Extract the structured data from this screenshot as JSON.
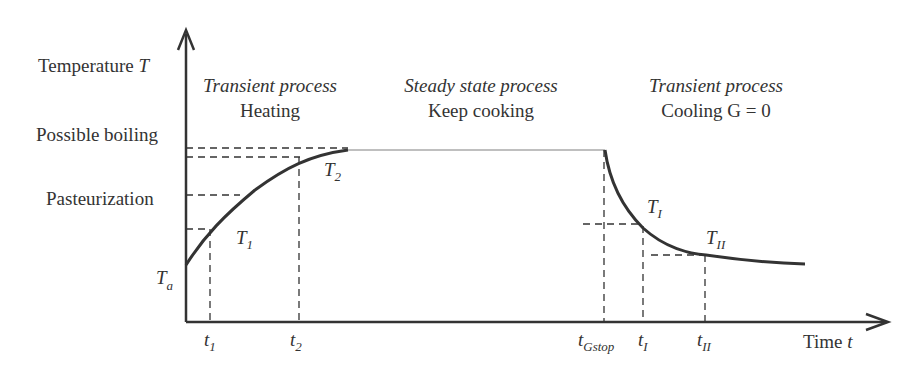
{
  "diagram": {
    "y_axis_label": "Temperature",
    "y_axis_symbol": "T",
    "x_axis_label": "Time",
    "x_axis_symbol": "t",
    "y_levels": {
      "possible_boiling": "Possible boiling",
      "pasteurization": "Pasteurization",
      "ambient": "T",
      "ambient_sub": "a"
    },
    "phases": [
      {
        "title": "Transient process",
        "subtitle": "Heating"
      },
      {
        "title": "Steady state process",
        "subtitle": "Keep cooking"
      },
      {
        "title": "Transient process",
        "subtitle": "Cooling G = 0"
      }
    ],
    "points": [
      {
        "label": "T",
        "sub": "1"
      },
      {
        "label": "T",
        "sub": "2"
      },
      {
        "label": "T",
        "sub": "I"
      },
      {
        "label": "T",
        "sub": "II"
      }
    ],
    "x_ticks": [
      {
        "label": "t",
        "sub": "1"
      },
      {
        "label": "t",
        "sub": "2"
      },
      {
        "label": "t",
        "sub": "Gstop"
      },
      {
        "label": "t",
        "sub": "I"
      },
      {
        "label": "t",
        "sub": "II"
      }
    ],
    "colors": {
      "ink": "#333333",
      "steady_line": "#aaaaaa"
    }
  }
}
